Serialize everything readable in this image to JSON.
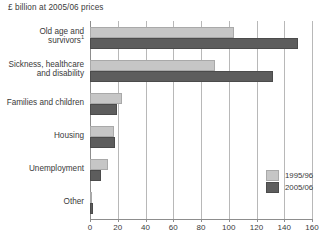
{
  "chart_data": {
    "type": "bar",
    "orientation": "horizontal",
    "title": "£ billion at 2005/06 prices",
    "xlabel": "",
    "ylabel": "",
    "xlim": [
      0,
      160
    ],
    "xticks": [
      0,
      20,
      40,
      60,
      80,
      100,
      120,
      140,
      160
    ],
    "xtick_labels": [
      "0",
      "20",
      "40",
      "60",
      "80",
      "100",
      "120",
      "140",
      "160"
    ],
    "grid": true,
    "grid_axis": "x",
    "legend_position": "lower-right",
    "categories": [
      "Old age and survivors",
      "Sickness, healthcare and disability",
      "Families and children",
      "Housing",
      "Unemployment",
      "Other"
    ],
    "category_lines": [
      [
        "Old age and",
        "survivors"
      ],
      [
        "Sickness, healthcare",
        "and disability"
      ],
      [
        "Families and children"
      ],
      [
        "Housing"
      ],
      [
        "Unemployment"
      ],
      [
        "Other"
      ]
    ],
    "category_footnotes": [
      "1",
      "",
      "",
      "",
      "",
      ""
    ],
    "series": [
      {
        "name": "1995/96",
        "color": "#c6c6c6",
        "values": [
          104,
          90,
          23,
          17,
          13,
          1.5
        ]
      },
      {
        "name": "2005/06",
        "color": "#5d5d5d",
        "values": [
          150,
          132,
          19.5,
          18,
          8,
          2.5
        ]
      }
    ]
  },
  "legend": {
    "items": [
      {
        "label": "1995/96"
      },
      {
        "label": "2005/06"
      }
    ]
  },
  "axis": {
    "tick_labels": [
      "0",
      "20",
      "40",
      "60",
      "80",
      "100",
      "120",
      "140",
      "160"
    ]
  },
  "colors": {
    "series_1995": "#c6c6c6",
    "series_2005": "#5d5d5d",
    "gridline": "#b8b8b8",
    "axis": "#8d8d8d",
    "text": "#3a3a3a",
    "background": "#ffffff"
  }
}
